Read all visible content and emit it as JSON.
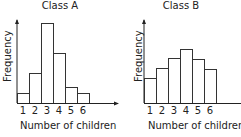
{
  "chart_data": [
    {
      "type": "bar",
      "title": "Class A",
      "xlabel": "Number of children",
      "ylabel": "Frequency",
      "categories": [
        "1",
        "2",
        "3",
        "4",
        "5",
        "6"
      ],
      "values": [
        1,
        3,
        8,
        5,
        1.6,
        1
      ],
      "grid": false,
      "y_ticks_shown": false,
      "histogram": true
    },
    {
      "type": "bar",
      "title": "Class B",
      "xlabel": "Number of children",
      "ylabel": "Frequency",
      "categories": [
        "1",
        "2",
        "3",
        "4",
        "5",
        "6"
      ],
      "values": [
        2.5,
        3.5,
        4.5,
        5.4,
        4.4,
        3.4
      ],
      "grid": false,
      "y_ticks_shown": false,
      "histogram": true
    }
  ],
  "colors": {
    "bar_fill": "#ffffff",
    "bar_stroke": "#333333",
    "axis": "#222222"
  }
}
